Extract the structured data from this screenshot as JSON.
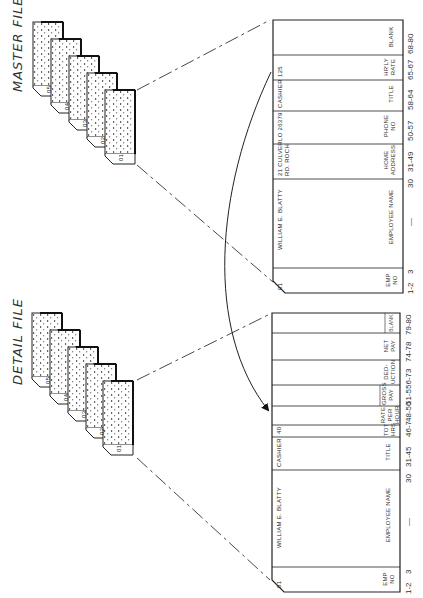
{
  "master_file": {
    "title": "MASTER FILE",
    "stack_cards": [
      "05",
      "04",
      "03",
      "02",
      "01"
    ],
    "card": {
      "record_no": "01",
      "fields": [
        {
          "label": "EMP NO",
          "label_lines": [
            "EMP",
            "NO"
          ],
          "value": "",
          "columns": "1-2"
        },
        {
          "label": "EMPLOYEE NAME",
          "label_lines": [
            "EMPLOYEE NAME"
          ],
          "value": "WILLIAM E. BLATTY",
          "columns": "3 — 30"
        },
        {
          "label": "HOME ADDRESS",
          "label_lines": [
            "HOME",
            "ADDRESS"
          ],
          "value_lines": [
            "21 CULVER",
            "RD. ROCH"
          ],
          "columns": "31-49"
        },
        {
          "label": "PHONE NO",
          "label_lines": [
            "PHONE",
            "NO"
          ],
          "value": "LO 26379",
          "columns": "50-57"
        },
        {
          "label": "TITLE",
          "label_lines": [
            "TITLE"
          ],
          "value": "CASHIER",
          "columns": "58-64"
        },
        {
          "label": "HR'LY RATE",
          "label_lines": [
            "HR'LY",
            "RATE"
          ],
          "value": "125",
          "columns": "65-67"
        },
        {
          "label": "BLANK",
          "label_lines": [
            "BLANK"
          ],
          "value": "",
          "columns": "68-80"
        }
      ],
      "column_ticks": [
        "1-2",
        "3",
        "—",
        "30",
        "31-49",
        "50-57",
        "58-64",
        "65-67",
        "68-80"
      ]
    }
  },
  "detail_file": {
    "title": "DETAIL FILE",
    "stack_cards": [
      "05",
      "04",
      "03",
      "02",
      "01"
    ],
    "card": {
      "record_no": "01",
      "fields": [
        {
          "label": "EMP NO",
          "label_lines": [
            "EMP",
            "NO"
          ],
          "value": "",
          "columns": "1-2"
        },
        {
          "label": "EMPLOYEE NAME",
          "label_lines": [
            "EMPLOYEE NAME"
          ],
          "value": "WILLIAM E. BLATTY",
          "columns": "3 — 30"
        },
        {
          "label": "TITLE",
          "label_lines": [
            "TITLE"
          ],
          "value": "CASHIER",
          "columns": "31-45"
        },
        {
          "label": "TOT HRS",
          "label_lines": [
            "TOT",
            "HRS"
          ],
          "value": "40",
          "columns": "46-48"
        },
        {
          "label": "RATE PER HOUR",
          "label_lines": [
            "RATE",
            "PER",
            "HOUR"
          ],
          "value": "",
          "columns": "49-50"
        },
        {
          "label": "GROSS PAY",
          "label_lines": [
            "GROSS",
            "PAY"
          ],
          "value": "",
          "columns": "51-55"
        },
        {
          "label": "DEDUCTION",
          "label_lines": [
            "DED-",
            "UCTION"
          ],
          "value": "",
          "columns": "56-73"
        },
        {
          "label": "NET PAY",
          "label_lines": [
            "NET",
            "PAY"
          ],
          "value": "",
          "columns": "74-78"
        },
        {
          "label": "BLANK",
          "label_lines": [
            "BLANK"
          ],
          "value": "",
          "columns": "79-80"
        }
      ],
      "column_ticks": [
        "1-2",
        "3",
        "—",
        "30",
        "31-45",
        "46-7",
        "48-50",
        "51-5",
        "56-73",
        "74-78",
        "79-80"
      ]
    }
  },
  "connector": {
    "description": "Curved arrow from master HR'LY RATE field to detail RATE PER HOUR field"
  }
}
